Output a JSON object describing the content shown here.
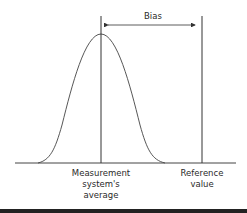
{
  "diagram": {
    "bias_label": "Bias",
    "mean_label": "Measurement\nsystem's\naverage",
    "reference_label": "Reference\nvalue",
    "colors": {
      "line": "#333333",
      "text": "#2a2a2a",
      "bottom_bar": "#222222"
    }
  }
}
